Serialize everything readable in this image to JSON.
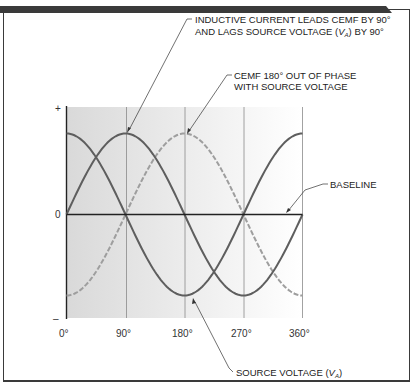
{
  "chart_data": {
    "type": "line",
    "title": "",
    "xlabel": "",
    "ylabel": "",
    "x_ticks": [
      "0°",
      "90°",
      "180°",
      "270°",
      "360°"
    ],
    "x_degrees": [
      0,
      90,
      180,
      270,
      360
    ],
    "y_ticks": [
      "+",
      "0",
      "–"
    ],
    "ylim": [
      -1.15,
      1.15
    ],
    "grid": "vertical lines at 90° intervals",
    "series": [
      {
        "name": "Source voltage (VA)",
        "style": "solid",
        "color": "#5a5a5a",
        "function": "cos",
        "values": [
          1,
          0,
          -1,
          0,
          1
        ]
      },
      {
        "name": "Inductive current",
        "style": "solid",
        "color": "#5a5a5a",
        "function": "sin",
        "values": [
          0,
          1,
          0,
          -1,
          0
        ]
      },
      {
        "name": "CEMF",
        "style": "dashed",
        "color": "#9a9a9a",
        "function": "-cos",
        "values": [
          -1,
          0,
          1,
          0,
          -1
        ]
      }
    ],
    "annotations": [
      {
        "line1": "INDUCTIVE CURRENT LEADS CEMF BY 90°",
        "line2_pre": "AND LAGS SOURCE VOLTAGE (",
        "line2_var": "V",
        "line2_sub": "A",
        "line2_post": ") BY 90°"
      },
      {
        "line1": "CEMF 180° OUT OF PHASE",
        "line2": "WITH SOURCE VOLTAGE"
      },
      {
        "line1": "BASELINE"
      },
      {
        "pre": "SOURCE VOLTAGE (",
        "var": "V",
        "sub": "A",
        "post": ")"
      }
    ]
  }
}
